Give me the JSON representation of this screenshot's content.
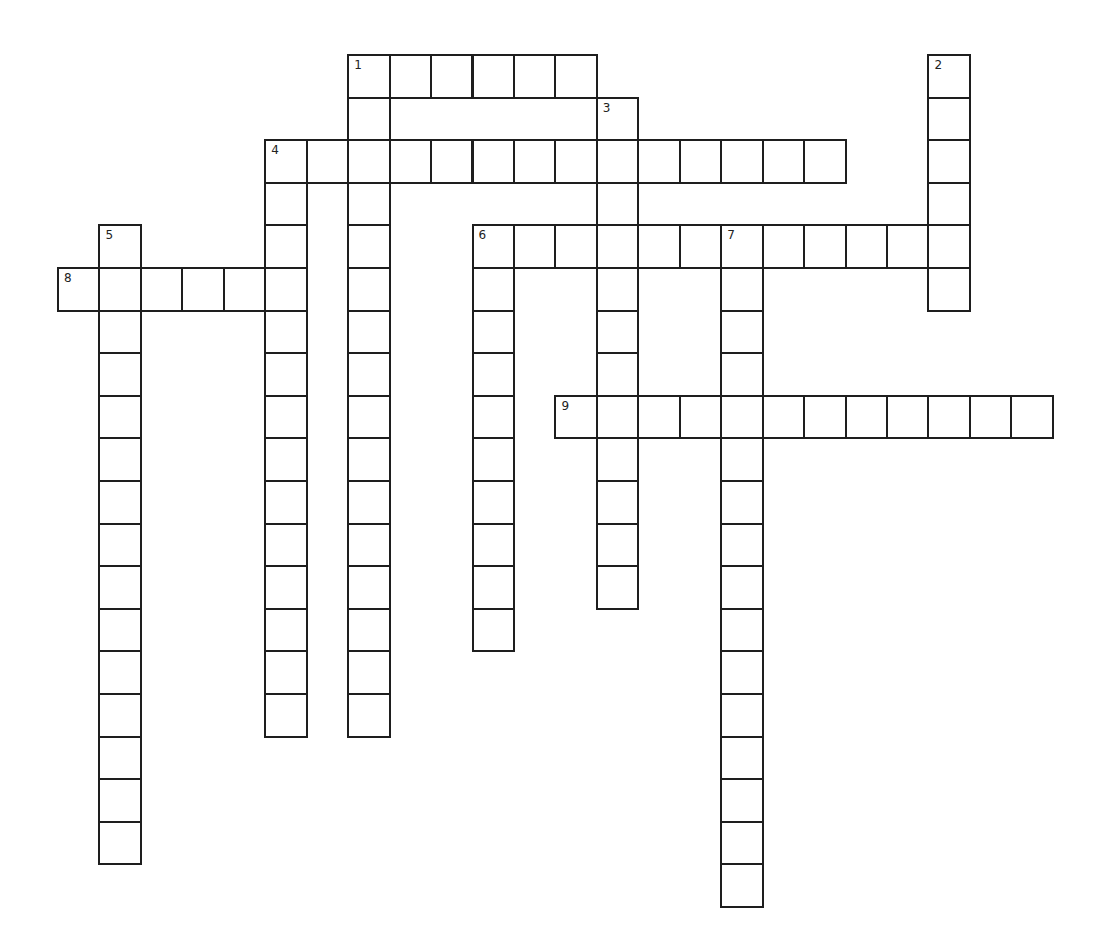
{
  "puzzle": {
    "grid": {
      "origin_x": 57,
      "origin_y": 54,
      "col_pitch": 41.45,
      "row_pitch": 42.6,
      "line_color": "#1e1e1e",
      "background": "#ffffff"
    },
    "words": [
      {
        "number": "1",
        "direction": "across",
        "row": 0,
        "col": 7,
        "length": 6
      },
      {
        "number": "1",
        "direction": "down",
        "row": 0,
        "col": 7,
        "length": 16
      },
      {
        "number": "2",
        "direction": "down",
        "row": 0,
        "col": 21,
        "length": 6
      },
      {
        "number": "3",
        "direction": "down",
        "row": 1,
        "col": 13,
        "length": 12
      },
      {
        "number": "4",
        "direction": "across",
        "row": 2,
        "col": 5,
        "length": 14
      },
      {
        "number": "4",
        "direction": "down",
        "row": 2,
        "col": 5,
        "length": 14
      },
      {
        "number": "5",
        "direction": "down",
        "row": 4,
        "col": 1,
        "length": 15
      },
      {
        "number": "6",
        "direction": "across",
        "row": 4,
        "col": 10,
        "length": 12
      },
      {
        "number": "6",
        "direction": "down",
        "row": 4,
        "col": 10,
        "length": 10
      },
      {
        "number": "7",
        "direction": "down",
        "row": 4,
        "col": 16,
        "length": 16
      },
      {
        "number": "8",
        "direction": "across",
        "row": 5,
        "col": 0,
        "length": 6
      },
      {
        "number": "9",
        "direction": "across",
        "row": 8,
        "col": 12,
        "length": 12
      }
    ],
    "clue_numbers": [
      {
        "number": "1",
        "row": 0,
        "col": 7
      },
      {
        "number": "2",
        "row": 0,
        "col": 21
      },
      {
        "number": "3",
        "row": 1,
        "col": 13
      },
      {
        "number": "4",
        "row": 2,
        "col": 5
      },
      {
        "number": "5",
        "row": 4,
        "col": 1
      },
      {
        "number": "6",
        "row": 4,
        "col": 10
      },
      {
        "number": "7",
        "row": 4,
        "col": 16
      },
      {
        "number": "8",
        "row": 5,
        "col": 0
      },
      {
        "number": "9",
        "row": 8,
        "col": 12
      }
    ],
    "letters": {}
  }
}
